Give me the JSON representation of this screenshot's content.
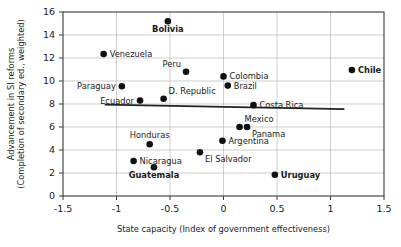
{
  "chart_data": {
    "type": "scatter",
    "title": "",
    "xlabel": "State capacity (Index of government effectiveness)",
    "ylabel_line1": "Advancement in SI reforms",
    "ylabel_line2": "(Completion of secondary ed., weighted)",
    "xlim": [
      -1.5,
      1.5
    ],
    "ylim": [
      0,
      16
    ],
    "xticks": [
      -1.5,
      -1,
      -0.5,
      0,
      0.5,
      1,
      1.5
    ],
    "xtick_labels": [
      "-1.5",
      "-1",
      "-0.5",
      "0",
      "0.5",
      "1",
      "1.5"
    ],
    "yticks": [
      0,
      2,
      4,
      6,
      8,
      10,
      12,
      14,
      16
    ],
    "ytick_labels": [
      "0",
      "2",
      "4",
      "6",
      "8",
      "10",
      "12",
      "14",
      "16"
    ],
    "grid": true,
    "grid_axis": "y",
    "legend": "none",
    "points": [
      {
        "label": "Bolivia",
        "x": -0.52,
        "y": 15.2,
        "label_pos": "below",
        "bold": true
      },
      {
        "label": "Venezuela",
        "x": -1.12,
        "y": 12.35,
        "label_pos": "right",
        "bold": false
      },
      {
        "label": "Chile",
        "x": 1.2,
        "y": 10.95,
        "label_pos": "right",
        "bold": true
      },
      {
        "label": "Peru",
        "x": -0.35,
        "y": 10.8,
        "label_pos": "above-left",
        "bold": false
      },
      {
        "label": "Colombia",
        "x": 0.0,
        "y": 10.4,
        "label_pos": "right",
        "bold": false
      },
      {
        "label": "Brazil",
        "x": 0.04,
        "y": 9.6,
        "label_pos": "right",
        "bold": false
      },
      {
        "label": "Paraguay",
        "x": -0.95,
        "y": 9.55,
        "label_pos": "left",
        "bold": false
      },
      {
        "label": "D. Republic",
        "x": -0.56,
        "y": 8.45,
        "label_pos": "above-right",
        "bold": false
      },
      {
        "label": "Ecuador",
        "x": -0.78,
        "y": 8.3,
        "label_pos": "left",
        "bold": false
      },
      {
        "label": "Costa Rica",
        "x": 0.28,
        "y": 7.9,
        "label_pos": "right",
        "bold": false
      },
      {
        "label": "Mexico",
        "x": 0.15,
        "y": 6.0,
        "label_pos": "above-right",
        "bold": false
      },
      {
        "label": "Panama",
        "x": 0.22,
        "y": 6.0,
        "label_pos": "below-right",
        "bold": false
      },
      {
        "label": "Argentina",
        "x": -0.01,
        "y": 4.8,
        "label_pos": "right",
        "bold": false
      },
      {
        "label": "Honduras",
        "x": -0.69,
        "y": 4.5,
        "label_pos": "above",
        "bold": false
      },
      {
        "label": "El Salvador",
        "x": -0.22,
        "y": 3.8,
        "label_pos": "below-right",
        "bold": false
      },
      {
        "label": "Nicaragua",
        "x": -0.84,
        "y": 3.05,
        "label_pos": "right",
        "bold": false
      },
      {
        "label": "Guatemala",
        "x": -0.65,
        "y": 2.5,
        "label_pos": "below",
        "bold": true
      },
      {
        "label": "Uruguay",
        "x": 0.48,
        "y": 1.85,
        "label_pos": "right",
        "bold": true
      }
    ],
    "trendline": {
      "x_start": -1.11,
      "y_start": 7.95,
      "x_end": 1.13,
      "y_end": 7.55
    }
  }
}
